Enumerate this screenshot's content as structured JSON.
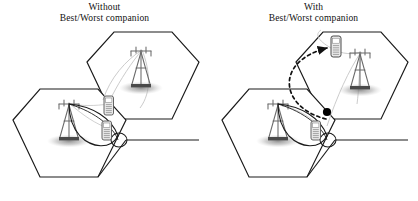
{
  "figure": {
    "type": "diagram",
    "width": 418,
    "height": 201,
    "background_color": "#ffffff"
  },
  "panels": [
    {
      "id": "left",
      "caption_line1": "Without",
      "caption_line2": "Best/Worst companion",
      "elements": {
        "hexagons": 2,
        "base_stations": 2,
        "mobile_phones": 2,
        "beam_lobe": 1,
        "dashed_arrow": false,
        "black_dot": false
      }
    },
    {
      "id": "right",
      "caption_line1": "With",
      "caption_line2": "Best/Worst companion",
      "elements": {
        "hexagons": 2,
        "base_stations": 2,
        "mobile_phones": 2,
        "beam_lobe": 1,
        "dashed_arrow": true,
        "black_dot": true
      }
    }
  ],
  "colors": {
    "cell_boundary": "#1a1a1a",
    "tower": "#555555",
    "signal_link": "#b9b9b9",
    "shadow": "#9a9a9a",
    "beam_outline": "#1a1a1a",
    "phone_body": "#6f6f6f",
    "phone_fill": "#e8e8e8",
    "dashed_arrow": "#111111",
    "black_dot": "#000000",
    "caption_text": "#111111"
  },
  "icons": {
    "base_station": "cell-tower-icon",
    "mobile": "mobile-phone-icon",
    "link": "signal-link-icon",
    "handover": "dashed-handover-arrow-icon",
    "interferer": "black-dot-icon"
  }
}
